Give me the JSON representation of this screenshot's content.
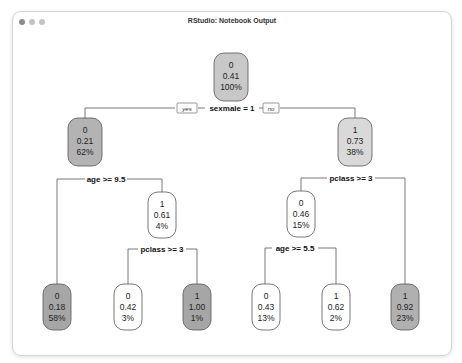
{
  "window": {
    "title": "RStudio: Notebook Output"
  },
  "tree": {
    "root": {
      "class": "0",
      "prob": "0.41",
      "pct": "100%",
      "fill": "#c8c8c8"
    },
    "root_split": {
      "label": "sexmale = 1",
      "yes": "yes",
      "no": "no"
    },
    "n2": {
      "class": "0",
      "prob": "0.21",
      "pct": "62%",
      "fill": "#b3b3b3"
    },
    "n3": {
      "class": "1",
      "prob": "0.73",
      "pct": "38%",
      "fill": "#d9d9d9"
    },
    "n2_split": {
      "label": "age >= 9.5"
    },
    "n3_split": {
      "label": "pclass >= 3"
    },
    "n5": {
      "class": "1",
      "prob": "0.61",
      "pct": "4%",
      "fill": "#ffffff"
    },
    "n6": {
      "class": "0",
      "prob": "0.46",
      "pct": "15%",
      "fill": "#ffffff"
    },
    "n5_split": {
      "label": "pclass >= 3"
    },
    "n6_split": {
      "label": "age >= 5.5"
    },
    "leaves": [
      {
        "class": "0",
        "prob": "0.18",
        "pct": "58%",
        "fill": "#a6a6a6"
      },
      {
        "class": "0",
        "prob": "0.42",
        "pct": "3%",
        "fill": "#ffffff"
      },
      {
        "class": "1",
        "prob": "1.00",
        "pct": "1%",
        "fill": "#a6a6a6"
      },
      {
        "class": "0",
        "prob": "0.43",
        "pct": "13%",
        "fill": "#ffffff"
      },
      {
        "class": "1",
        "prob": "0.62",
        "pct": "2%",
        "fill": "#ffffff"
      },
      {
        "class": "1",
        "prob": "0.92",
        "pct": "23%",
        "fill": "#b0b0b0"
      }
    ]
  }
}
